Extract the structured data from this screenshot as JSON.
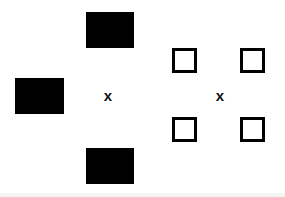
{
  "figure": {
    "width": 285,
    "height": 197,
    "background_color": "#ffffff",
    "ink_color": "#000000"
  },
  "panels": [
    {
      "id": "left",
      "name": "filled-rectangle-configuration",
      "fixation": {
        "glyph": "x",
        "cx": 108,
        "cy": 95
      },
      "shapes": [
        {
          "name": "filled-rect-top",
          "fill": "#000000",
          "x": 86,
          "y": 12,
          "w": 48,
          "h": 36,
          "position": "top"
        },
        {
          "name": "filled-rect-left",
          "fill": "#000000",
          "x": 15,
          "y": 78,
          "w": 49,
          "h": 36,
          "position": "left"
        },
        {
          "name": "filled-rect-bottom",
          "fill": "#000000",
          "x": 86,
          "y": 148,
          "w": 48,
          "h": 36,
          "position": "bottom"
        }
      ]
    },
    {
      "id": "right",
      "name": "outlined-square-configuration",
      "fixation": {
        "glyph": "x",
        "cx": 220,
        "cy": 95
      },
      "shapes": [
        {
          "name": "outline-square-top-left",
          "stroke": "#000000",
          "stroke_width": 3,
          "x": 172,
          "y": 48,
          "w": 25,
          "h": 25,
          "position": "top-left"
        },
        {
          "name": "outline-square-top-right",
          "stroke": "#000000",
          "stroke_width": 3,
          "x": 240,
          "y": 48,
          "w": 25,
          "h": 25,
          "position": "top-right"
        },
        {
          "name": "outline-square-bottom-left",
          "stroke": "#000000",
          "stroke_width": 3,
          "x": 172,
          "y": 117,
          "w": 25,
          "h": 25,
          "position": "bottom-left"
        },
        {
          "name": "outline-square-bottom-right",
          "stroke": "#000000",
          "stroke_width": 3,
          "x": 240,
          "y": 117,
          "w": 25,
          "h": 25,
          "position": "bottom-right"
        }
      ]
    }
  ],
  "artifacts": {
    "bottom_band_color": "#f4f4f4"
  }
}
